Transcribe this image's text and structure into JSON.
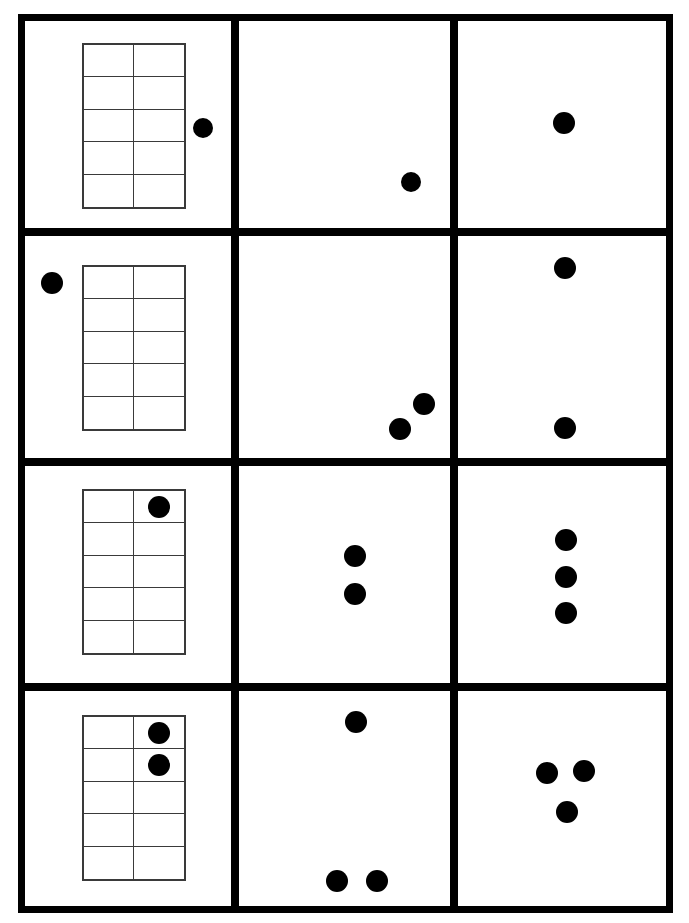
{
  "worksheet": {
    "title": "Ten-Frame Counting Worksheet",
    "width": 689,
    "height": 923,
    "background_color": "#ffffff",
    "ink_color": "#000000",
    "frame_line_color": "#3a3a3a",
    "outer_border_px": 7,
    "columns": 3,
    "rows": 4
  },
  "table": {
    "left": 18,
    "top": 14,
    "width": 655,
    "height": 899,
    "column_dividers_x": [
      231,
      450
    ],
    "row_dividers_y": [
      228,
      458,
      683
    ],
    "divider_thickness": 8
  },
  "rows": [
    {
      "index": 1,
      "label": "row-1",
      "cells": [
        {
          "index": 1,
          "label": "cell-r1c1",
          "type": "ten-frame-with-loose-counter",
          "ten_frame": {
            "left": 82,
            "top": 43,
            "width": 104,
            "height": 166,
            "columns": 2,
            "rows": 5,
            "capacity": 10,
            "filled_cells": [],
            "filled_count": 0
          },
          "loose_dots": [
            {
              "cx": 203,
              "cy": 128,
              "r": 10
            }
          ],
          "total_count": 1
        },
        {
          "index": 2,
          "label": "cell-r1c2",
          "type": "loose-counters",
          "dots": [
            {
              "cx": 411,
              "cy": 182,
              "r": 10
            }
          ],
          "total_count": 1
        },
        {
          "index": 3,
          "label": "cell-r1c3",
          "type": "loose-counters",
          "dots": [
            {
              "cx": 564,
              "cy": 123,
              "r": 11
            }
          ],
          "total_count": 1
        }
      ]
    },
    {
      "index": 2,
      "label": "row-2",
      "cells": [
        {
          "index": 1,
          "label": "cell-r2c1",
          "type": "ten-frame-with-loose-counter",
          "ten_frame": {
            "left": 82,
            "top": 265,
            "width": 104,
            "height": 166,
            "columns": 2,
            "rows": 5,
            "capacity": 10,
            "filled_cells": [],
            "filled_count": 0
          },
          "loose_dots": [
            {
              "cx": 52,
              "cy": 283,
              "r": 11
            }
          ],
          "total_count": 1
        },
        {
          "index": 2,
          "label": "cell-r2c2",
          "type": "loose-counters",
          "dots": [
            {
              "cx": 424,
              "cy": 404,
              "r": 11
            },
            {
              "cx": 400,
              "cy": 429,
              "r": 11
            }
          ],
          "total_count": 2
        },
        {
          "index": 3,
          "label": "cell-r2c3",
          "type": "loose-counters",
          "dots": [
            {
              "cx": 565,
              "cy": 268,
              "r": 11
            },
            {
              "cx": 565,
              "cy": 428,
              "r": 11
            }
          ],
          "total_count": 2
        }
      ]
    },
    {
      "index": 3,
      "label": "row-3",
      "cells": [
        {
          "index": 1,
          "label": "cell-r3c1",
          "type": "ten-frame",
          "ten_frame": {
            "left": 82,
            "top": 489,
            "width": 104,
            "height": 166,
            "columns": 2,
            "rows": 5,
            "capacity": 10,
            "filled_cells": [
              2
            ],
            "filled_count": 1
          },
          "loose_dots": [],
          "total_count": 1
        },
        {
          "index": 2,
          "label": "cell-r3c2",
          "type": "loose-counters",
          "dots": [
            {
              "cx": 355,
              "cy": 556,
              "r": 11
            },
            {
              "cx": 355,
              "cy": 594,
              "r": 11
            }
          ],
          "total_count": 2
        },
        {
          "index": 3,
          "label": "cell-r3c3",
          "type": "loose-counters",
          "dots": [
            {
              "cx": 566,
              "cy": 540,
              "r": 11
            },
            {
              "cx": 566,
              "cy": 577,
              "r": 11
            },
            {
              "cx": 566,
              "cy": 613,
              "r": 11
            }
          ],
          "total_count": 3
        }
      ]
    },
    {
      "index": 4,
      "label": "row-4",
      "cells": [
        {
          "index": 1,
          "label": "cell-r4c1",
          "type": "ten-frame",
          "ten_frame": {
            "left": 82,
            "top": 715,
            "width": 104,
            "height": 166,
            "columns": 2,
            "rows": 5,
            "capacity": 10,
            "filled_cells": [
              2,
              4
            ],
            "filled_count": 2
          },
          "loose_dots": [],
          "total_count": 2
        },
        {
          "index": 2,
          "label": "cell-r4c2",
          "type": "loose-counters",
          "dots": [
            {
              "cx": 356,
              "cy": 722,
              "r": 11
            },
            {
              "cx": 337,
              "cy": 881,
              "r": 11
            },
            {
              "cx": 377,
              "cy": 881,
              "r": 11
            }
          ],
          "total_count": 3
        },
        {
          "index": 3,
          "label": "cell-r4c3",
          "type": "loose-counters",
          "dots": [
            {
              "cx": 547,
              "cy": 773,
              "r": 11
            },
            {
              "cx": 584,
              "cy": 771,
              "r": 11
            },
            {
              "cx": 567,
              "cy": 812,
              "r": 11
            }
          ],
          "total_count": 3
        }
      ]
    }
  ]
}
